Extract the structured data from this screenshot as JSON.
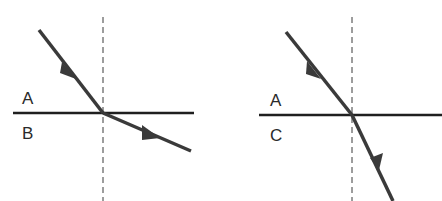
{
  "diagrams": [
    {
      "id": "left",
      "upper_medium_label": "A",
      "lower_medium_label": "B",
      "description": "Ray passes from medium A into medium B, bending away from the normal"
    },
    {
      "id": "right",
      "upper_medium_label": "A",
      "lower_medium_label": "C",
      "description": "Ray passes from medium A into medium C, bending toward the normal"
    }
  ],
  "colors": {
    "ray": "#3a3a3a",
    "interface": "#1f1f1f",
    "normal": "#3a3a3a",
    "background": "#ffffff"
  }
}
